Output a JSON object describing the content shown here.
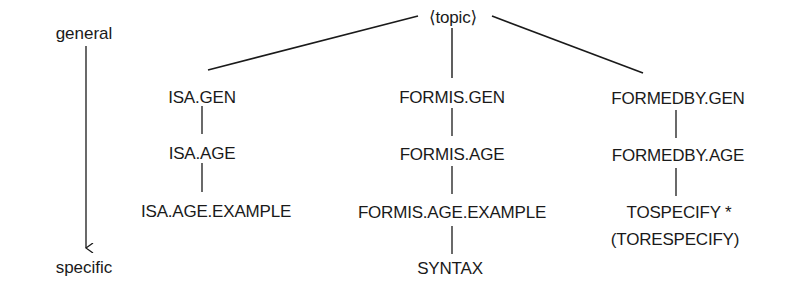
{
  "diagram": {
    "axis": {
      "top_label": "general",
      "bottom_label": "specific"
    },
    "root": {
      "label": "⟨topic⟩"
    },
    "columns": [
      {
        "id": "isa",
        "nodes": [
          "ISA.GEN",
          "ISA.AGE",
          "ISA.AGE.EXAMPLE"
        ]
      },
      {
        "id": "formis",
        "nodes": [
          "FORMIS.GEN",
          "FORMIS.AGE",
          "FORMIS.AGE.EXAMPLE",
          "SYNTAX"
        ]
      },
      {
        "id": "formedby",
        "nodes": [
          "FORMEDBY.GEN",
          "FORMEDBY.AGE",
          "TOSPECIFY *",
          "(TORESPECIFY)"
        ]
      }
    ],
    "edges": [
      [
        "⟨topic⟩",
        "ISA.GEN"
      ],
      [
        "⟨topic⟩",
        "FORMIS.GEN"
      ],
      [
        "⟨topic⟩",
        "FORMEDBY.GEN"
      ],
      [
        "ISA.GEN",
        "ISA.AGE"
      ],
      [
        "ISA.AGE",
        "ISA.AGE.EXAMPLE"
      ],
      [
        "FORMIS.GEN",
        "FORMIS.AGE"
      ],
      [
        "FORMIS.AGE",
        "FORMIS.AGE.EXAMPLE"
      ],
      [
        "FORMIS.AGE.EXAMPLE",
        "SYNTAX"
      ],
      [
        "FORMEDBY.GEN",
        "FORMEDBY.AGE"
      ],
      [
        "FORMEDBY.AGE",
        "TOSPECIFY *"
      ]
    ]
  }
}
